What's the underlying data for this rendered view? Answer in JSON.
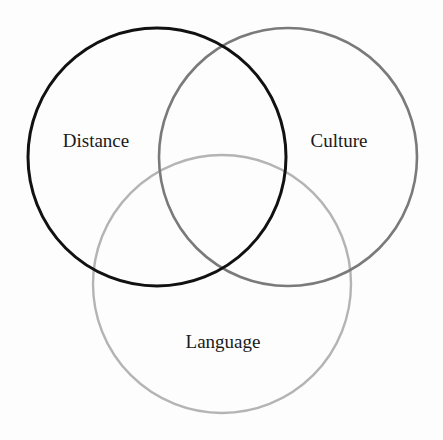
{
  "diagram": {
    "type": "venn",
    "sets": [
      {
        "label": "Distance",
        "color": "#111111",
        "cx": 157,
        "cy": 157,
        "r": 129,
        "stroke_width": 3,
        "label_x": 96,
        "label_y": 147
      },
      {
        "label": "Culture",
        "color": "#7a7a7a",
        "cx": 288,
        "cy": 157,
        "r": 129,
        "stroke_width": 2.6,
        "label_x": 339,
        "label_y": 147
      },
      {
        "label": "Language",
        "color": "#b4b4b4",
        "cx": 222,
        "cy": 284,
        "r": 129,
        "stroke_width": 2.4,
        "label_x": 223,
        "label_y": 348
      }
    ]
  }
}
